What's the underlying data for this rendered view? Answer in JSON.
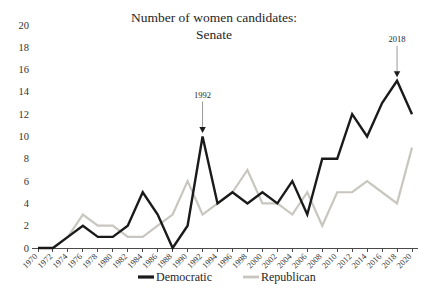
{
  "chart_data": {
    "type": "line",
    "title": "Number of women candidates:",
    "subtitle": "Senate",
    "xlabel": "",
    "ylabel": "",
    "ylim": [
      0,
      20
    ],
    "ytick_step": 2,
    "grid": false,
    "legend_position": "bottom",
    "x": [
      1970,
      1972,
      1974,
      1976,
      1978,
      1980,
      1982,
      1984,
      1986,
      1988,
      1990,
      1992,
      1994,
      1996,
      1998,
      2000,
      2002,
      2004,
      2006,
      2008,
      2010,
      2012,
      2014,
      2016,
      2018,
      2020
    ],
    "categories": [
      "1970",
      "1972",
      "1974",
      "1976",
      "1978",
      "1980",
      "1982",
      "1984",
      "1986",
      "1988",
      "1990",
      "1992",
      "1994",
      "1996",
      "1998",
      "2000",
      "2002",
      "2004",
      "2006",
      "2008",
      "2010",
      "2012",
      "2014",
      "2016",
      "2018",
      "2020"
    ],
    "yticks": [
      0,
      2,
      4,
      6,
      8,
      10,
      12,
      14,
      16,
      18,
      20
    ],
    "ytick_labels": [
      "0",
      "2",
      "4",
      "6",
      "8",
      "10",
      "12",
      "14",
      "16",
      "18",
      "20"
    ],
    "series": [
      {
        "name": "Democratic",
        "color": "#1a1a1a",
        "values": [
          0,
          0,
          1,
          2,
          1,
          1,
          2,
          5,
          3,
          0,
          2,
          10,
          4,
          5,
          4,
          5,
          4,
          6,
          3,
          8,
          8,
          12,
          10,
          13,
          15,
          12
        ]
      },
      {
        "name": "Republican",
        "color": "#c8c6bf",
        "values": [
          0,
          0,
          1,
          3,
          2,
          2,
          1,
          1,
          2,
          3,
          6,
          3,
          4,
          5,
          7,
          4,
          4,
          3,
          5,
          2,
          5,
          5,
          6,
          5,
          4,
          9
        ]
      }
    ],
    "annotations": [
      {
        "label": "1992",
        "year": 1992,
        "value": 10,
        "series": "Democratic"
      },
      {
        "label": "2018",
        "year": 2018,
        "value": 15,
        "series": "Democratic"
      }
    ]
  },
  "legend": {
    "items": [
      {
        "label": "Democratic",
        "color": "#1a1a1a"
      },
      {
        "label": "Republican",
        "color": "#c8c6bf"
      }
    ]
  }
}
